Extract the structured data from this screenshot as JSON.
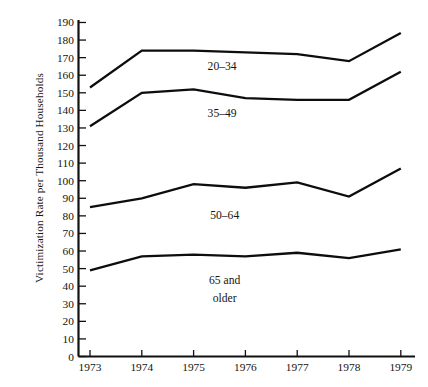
{
  "chart_data": {
    "type": "line",
    "title": "",
    "xlabel": "",
    "ylabel": "Victimization Rate per Thousand Households",
    "x": [
      "1973",
      "1974",
      "1975",
      "1976",
      "1977",
      "1978",
      "1979"
    ],
    "categories": [
      "1973",
      "1974",
      "1975",
      "1976",
      "1977",
      "1978",
      "1979"
    ],
    "ylim": [
      0,
      190
    ],
    "ytick_step": 10,
    "yticks": [
      0,
      10,
      20,
      30,
      40,
      50,
      60,
      70,
      80,
      90,
      100,
      110,
      120,
      130,
      140,
      150,
      160,
      170,
      180,
      190
    ],
    "grid": false,
    "legend_position": "inline-annotations",
    "series": [
      {
        "name": "20–34",
        "label": "20–34",
        "label_lines": [
          "20–34"
        ],
        "values": [
          153,
          174,
          174,
          173,
          172,
          168,
          184
        ]
      },
      {
        "name": "35–49",
        "label": "35–49",
        "label_lines": [
          "35–49"
        ],
        "values": [
          131,
          150,
          152,
          147,
          146,
          146,
          162
        ]
      },
      {
        "name": "50–64",
        "label": "50–64",
        "label_lines": [
          "50–64"
        ],
        "values": [
          85,
          90,
          98,
          96,
          99,
          91,
          107
        ]
      },
      {
        "name": "65 and older",
        "label": "65 and older",
        "label_lines": [
          "65 and",
          "older"
        ],
        "values": [
          49,
          57,
          58,
          57,
          59,
          56,
          61
        ]
      }
    ],
    "annotations": [
      {
        "text": "20–34",
        "x": "1975.55",
        "y": 163
      },
      {
        "text": "35–49",
        "x": "1975.55",
        "y": 136
      },
      {
        "text": "50–64",
        "x": "1975.6",
        "y": 78
      },
      {
        "text": "65 and",
        "x": "1975.6",
        "y": 41
      },
      {
        "text": "older",
        "x": "1975.6",
        "y": 31
      }
    ],
    "colors": {
      "line": "#0d0d0d",
      "axis": "#111111",
      "text": "#141414",
      "background": "#ffffff"
    }
  }
}
